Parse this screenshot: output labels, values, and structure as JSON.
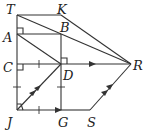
{
  "diagram": {
    "type": "geometry",
    "points": {
      "T": {
        "label": "T",
        "x": 17,
        "y": 15
      },
      "K": {
        "label": "K",
        "x": 61,
        "y": 15
      },
      "A": {
        "label": "A",
        "x": 17,
        "y": 34
      },
      "B": {
        "label": "B",
        "x": 61,
        "y": 34
      },
      "C": {
        "label": "C",
        "x": 17,
        "y": 64
      },
      "D": {
        "label": "D",
        "x": 61,
        "y": 64
      },
      "R": {
        "label": "R",
        "x": 131,
        "y": 64
      },
      "J": {
        "label": "J",
        "x": 17,
        "y": 110
      },
      "G": {
        "label": "G",
        "x": 61,
        "y": 110
      },
      "S": {
        "label": "S",
        "x": 90,
        "y": 110
      }
    },
    "segments": [
      "TK",
      "KR",
      "TR",
      "TJ",
      "AB",
      "AD",
      "BG",
      "CR",
      "JD",
      "JG",
      "GS",
      "SR"
    ],
    "right_angles": [
      "A",
      "C",
      "D",
      "J"
    ],
    "congruence_ticks": [
      "CD",
      "JC",
      "DG",
      "JG"
    ],
    "parallel_arrows": {
      "single": [
        "CR",
        "JG"
      ],
      "double": [
        "JD",
        "SR"
      ]
    }
  }
}
